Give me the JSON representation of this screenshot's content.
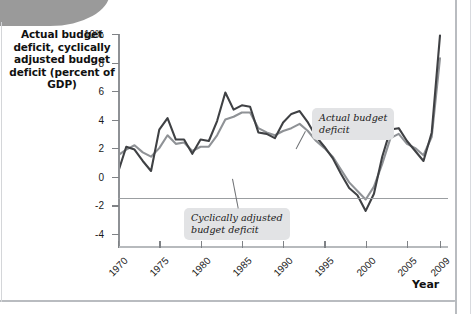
{
  "figure": {
    "y_axis_title": "Actual budget deficit, cyclically adjusted budget deficit (percent of GDP)",
    "x_axis_title": "Year",
    "annotation_actual": "Actual budget\ndeficit",
    "annotation_cyclical": "Cyclically adjusted\nbudget deficit"
  },
  "colors": {
    "actual_line": "#3f4144",
    "cyclical_line": "#8f9296",
    "axis": "#8e9195",
    "annotation_bg": "#e2e3e5",
    "corner_blob": "#9a9a9a"
  },
  "chart_data": {
    "type": "line",
    "title": "",
    "xlabel": "Year",
    "ylabel": "Actual budget deficit, cyclically adjusted budget deficit (percent of GDP)",
    "xlim": [
      1970,
      2009
    ],
    "ylim": [
      -5,
      10
    ],
    "xticks": [
      1970,
      1975,
      1980,
      1985,
      1990,
      1995,
      2000,
      2005,
      2009
    ],
    "xtick_labels": [
      "1970",
      "1975",
      "1980",
      "1985",
      "1990",
      "1995",
      "2000",
      "2005",
      "2009"
    ],
    "yticks": [
      -4,
      -2,
      0,
      2,
      4,
      6,
      8,
      10
    ],
    "ytick_labels": [
      "-4",
      "-2",
      "0",
      "2",
      "4",
      "6",
      "8",
      "10%"
    ],
    "grid": false,
    "legend": "annotations",
    "x": [
      1970,
      1971,
      1972,
      1973,
      1974,
      1975,
      1976,
      1977,
      1978,
      1979,
      1980,
      1981,
      1982,
      1983,
      1984,
      1985,
      1986,
      1987,
      1988,
      1989,
      1990,
      1991,
      1992,
      1993,
      1994,
      1995,
      1996,
      1997,
      1998,
      1999,
      2000,
      2001,
      2002,
      2003,
      2004,
      2005,
      2006,
      2007,
      2008,
      2009
    ],
    "series": [
      {
        "name": "Actual budget deficit",
        "color": "#3f4144",
        "values": [
          0.3,
          2.1,
          1.9,
          1.1,
          0.4,
          3.3,
          4.1,
          2.6,
          2.6,
          1.6,
          2.6,
          2.5,
          3.9,
          5.9,
          4.7,
          5.0,
          4.9,
          3.1,
          3.0,
          2.7,
          3.8,
          4.4,
          4.6,
          3.8,
          2.8,
          2.1,
          1.3,
          0.2,
          -0.8,
          -1.3,
          -2.4,
          -1.2,
          1.4,
          3.3,
          3.4,
          2.5,
          1.8,
          1.1,
          3.1,
          9.9
        ]
      },
      {
        "name": "Cyclically adjusted budget deficit",
        "color": "#8f9296",
        "values": [
          1.5,
          1.9,
          2.2,
          1.7,
          1.4,
          2.0,
          2.9,
          2.3,
          2.4,
          1.8,
          2.1,
          2.1,
          2.9,
          4.0,
          4.2,
          4.5,
          4.5,
          3.4,
          3.1,
          2.9,
          3.2,
          3.4,
          3.7,
          3.2,
          2.5,
          2.0,
          1.4,
          0.5,
          -0.4,
          -1.0,
          -1.6,
          -0.7,
          0.9,
          2.7,
          3.0,
          2.3,
          2.0,
          1.5,
          2.8,
          8.3
        ]
      }
    ]
  }
}
